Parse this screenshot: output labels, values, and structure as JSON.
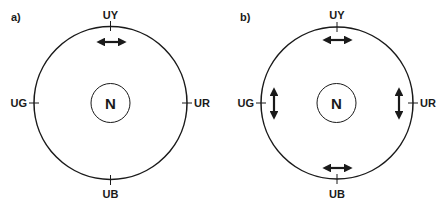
{
  "panels": [
    {
      "label": "a)",
      "center_label": "N",
      "positions": {
        "top": "UY",
        "right": "UR",
        "bottom": "UB",
        "left": "UG"
      },
      "arrows": [
        {
          "at": "UY",
          "orientation": "horizontal"
        }
      ]
    },
    {
      "label": "b)",
      "center_label": "N",
      "positions": {
        "top": "UY",
        "right": "UR",
        "bottom": "UB",
        "left": "UG"
      },
      "arrows": [
        {
          "at": "UY",
          "orientation": "horizontal"
        },
        {
          "at": "UR",
          "orientation": "vertical"
        },
        {
          "at": "UB",
          "orientation": "horizontal"
        },
        {
          "at": "UG",
          "orientation": "vertical"
        }
      ]
    }
  ],
  "colors": {
    "stroke": "#1a1a1a",
    "background": "#ffffff"
  }
}
